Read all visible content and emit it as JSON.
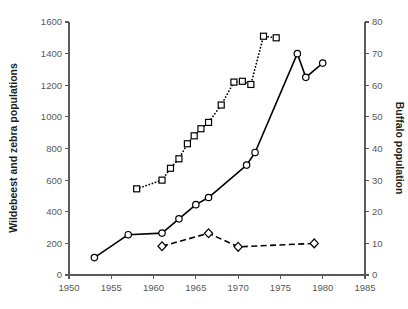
{
  "chart_data": {
    "type": "line",
    "title": "",
    "xlabel": "",
    "ylabel": "Wildebeest and zebra populations",
    "y2label": "Buffalo population",
    "xlim": [
      1950,
      1985
    ],
    "ylim": [
      0,
      1600
    ],
    "y2lim": [
      0,
      80
    ],
    "grid": false,
    "legend": "none",
    "x_ticks": [
      1950,
      1955,
      1960,
      1965,
      1970,
      1975,
      1980,
      1985
    ],
    "y_ticks": [
      0,
      200,
      400,
      600,
      800,
      1000,
      1200,
      1400,
      1600
    ],
    "y2_ticks": [
      0,
      10,
      20,
      30,
      40,
      50,
      60,
      70,
      80
    ],
    "series": [
      {
        "name": "wildebeest",
        "axis": "left",
        "marker": "circle",
        "linestyle": "solid",
        "points": [
          [
            1953,
            110
          ],
          [
            1957,
            255
          ],
          [
            1961,
            265
          ],
          [
            1963,
            355
          ],
          [
            1965,
            445
          ],
          [
            1966.5,
            490
          ],
          [
            1971,
            695
          ],
          [
            1972,
            775
          ],
          [
            1977,
            1400
          ],
          [
            1978,
            1250
          ],
          [
            1980,
            1340
          ]
        ]
      },
      {
        "name": "zebra",
        "axis": "left",
        "marker": "square",
        "linestyle": "dotted",
        "points": [
          [
            1958,
            545
          ],
          [
            1961,
            600
          ],
          [
            1962,
            675
          ],
          [
            1963,
            735
          ],
          [
            1964,
            830
          ],
          [
            1964.8,
            880
          ],
          [
            1965.6,
            925
          ],
          [
            1966.5,
            965
          ],
          [
            1968,
            1075
          ],
          [
            1969.5,
            1220
          ],
          [
            1970.5,
            1225
          ],
          [
            1971.5,
            1205
          ],
          [
            1973,
            1510
          ],
          [
            1974.5,
            1500
          ]
        ]
      },
      {
        "name": "buffalo",
        "axis": "right",
        "marker": "diamond",
        "linestyle": "dashed",
        "points": [
          [
            1961,
            9.1
          ],
          [
            1966.5,
            13.2
          ],
          [
            1970,
            8.9
          ],
          [
            1979,
            10.0
          ]
        ]
      }
    ]
  },
  "colors": {
    "axis": "#59595b",
    "text": "#231f20",
    "tick_text": "#58585a",
    "series": "#000000",
    "marker_fill": "#ffffff",
    "background": "#ffffff"
  }
}
